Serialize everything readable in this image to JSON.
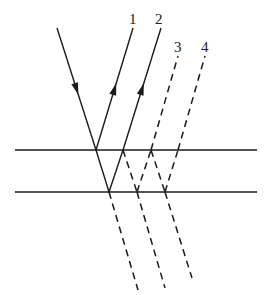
{
  "diagram": {
    "type": "thin-film multiple reflection",
    "stroke_color": "#1a1a1a",
    "surfaces": [
      {
        "name": "top-surface",
        "y": 150,
        "x1": 15,
        "x2": 257
      },
      {
        "name": "bottom-surface",
        "y": 192,
        "x1": 15,
        "x2": 257
      }
    ],
    "labels": [
      {
        "text": "1",
        "x": 129,
        "y": 12
      },
      {
        "text": "2",
        "x": 155,
        "y": 12
      },
      {
        "text": "3",
        "x": 174,
        "y": 40
      },
      {
        "text": "4",
        "x": 201,
        "y": 40
      }
    ],
    "rays": {
      "incident": {
        "from": [
          57,
          28
        ],
        "to": [
          96,
          150
        ],
        "style": "solid",
        "arrow": "down"
      },
      "reflected": [
        {
          "label": "1",
          "from": [
            96,
            150
          ],
          "to": [
            133,
            28
          ],
          "style": "solid",
          "arrow": "up"
        },
        {
          "label": "2",
          "from": [
            123,
            150
          ],
          "to": [
            161,
            28
          ],
          "style": "solid",
          "arrow": "up"
        },
        {
          "label": "3",
          "from": [
            151,
            150
          ],
          "to": [
            178,
            56
          ],
          "style": "dashed"
        },
        {
          "label": "4",
          "from": [
            178,
            150
          ],
          "to": [
            205,
            56
          ],
          "style": "dashed"
        }
      ],
      "internal": [
        {
          "from": [
            96,
            150
          ],
          "to": [
            109,
            192
          ],
          "style": "solid"
        },
        {
          "from": [
            109,
            192
          ],
          "to": [
            123,
            150
          ],
          "style": "solid"
        },
        {
          "from": [
            123,
            150
          ],
          "to": [
            137,
            192
          ],
          "style": "dashed"
        },
        {
          "from": [
            137,
            192
          ],
          "to": [
            151,
            150
          ],
          "style": "dashed"
        },
        {
          "from": [
            151,
            150
          ],
          "to": [
            165,
            192
          ],
          "style": "dashed"
        },
        {
          "from": [
            165,
            192
          ],
          "to": [
            178,
            150
          ],
          "style": "dashed"
        }
      ],
      "transmitted": [
        {
          "from": [
            109,
            192
          ],
          "to": [
            138,
            290
          ],
          "style": "dashed"
        },
        {
          "from": [
            137,
            192
          ],
          "to": [
            165,
            288
          ],
          "style": "dashed"
        },
        {
          "from": [
            165,
            192
          ],
          "to": [
            192,
            278
          ],
          "style": "dashed"
        }
      ]
    }
  }
}
